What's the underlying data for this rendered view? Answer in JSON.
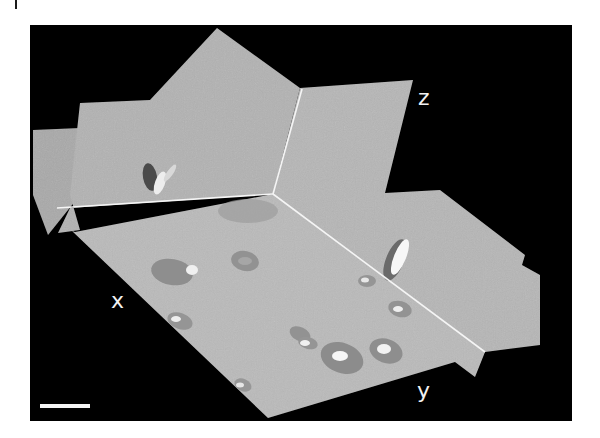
{
  "figure": {
    "background_color": "#000000",
    "plane_color": "#b4b4b4",
    "intersection_line_color": "#f5f5f5",
    "axis_labels": {
      "x": "x",
      "y": "y",
      "z": "z"
    },
    "scale_bar": {
      "label": "",
      "color": "#f4f4f4"
    }
  }
}
